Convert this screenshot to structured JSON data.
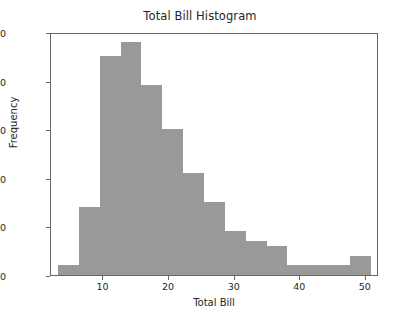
{
  "chart_data": {
    "type": "bar",
    "title": "Total Bill Histogram",
    "xlabel": "Total Bill",
    "ylabel": "Frequency",
    "xlim": [
      2.0,
      52.0
    ],
    "ylim": [
      0,
      50
    ],
    "grid": false,
    "legend": null,
    "bar_color": "#999999",
    "axis_color": "#666666",
    "text_color": "#262626",
    "bin_edges": [
      3.07,
      10.26,
      13.45,
      16.63,
      19.82,
      23.0,
      26.19,
      29.37,
      32.56,
      35.74,
      38.93,
      42.11,
      45.3,
      48.48,
      50.81
    ],
    "bin_width": 3.18,
    "bin_start": 3.07,
    "categories": [
      "3.1-6.3",
      "6.3-9.4",
      "9.4-12.6",
      "12.6-15.8",
      "15.8-19.0",
      "19.0-22.2",
      "22.2-25.3",
      "25.3-28.5",
      "28.5-31.7",
      "31.7-34.9",
      "34.9-38.1",
      "38.1-41.2",
      "41.2-44.4",
      "44.4-47.6",
      "47.6-50.8"
    ],
    "values": [
      2,
      14,
      45,
      48,
      39,
      30,
      21,
      15,
      9,
      7,
      6,
      2,
      2,
      2,
      4
    ],
    "xticks": [
      10,
      20,
      30,
      40,
      50
    ],
    "xtick_labels": [
      "10",
      "20",
      "30",
      "40",
      "50"
    ],
    "yticks": [
      0,
      10,
      20,
      30,
      40,
      50
    ],
    "ytick_labels": [
      "0",
      "10",
      "20",
      "30",
      "40",
      "50"
    ]
  }
}
